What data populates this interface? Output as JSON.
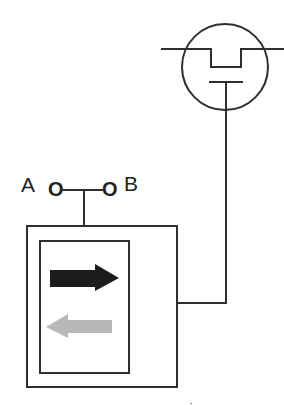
{
  "diagram": {
    "type": "schematic",
    "labels": {
      "terminal_a": "A",
      "terminal_b": "B",
      "node_a_glyph": "O",
      "node_b_glyph": "O"
    },
    "colors": {
      "stroke": "#2f2f2f",
      "forward_arrow": "#1c1c1c",
      "reverse_arrow": "#b8b8b8",
      "background": "#ffffff"
    },
    "components": [
      {
        "id": "transistor",
        "symbol": "circle-with-notched-channel-and-gate",
        "description": "field-effect device symbol"
      },
      {
        "id": "switch",
        "terminals": [
          "A",
          "B"
        ],
        "description": "two-terminal node joined by a horizontal bar with center stem"
      },
      {
        "id": "module",
        "description": "outer box containing inner panel with two direction arrows"
      },
      {
        "id": "forward-arrow",
        "direction": "right",
        "shade": "dark"
      },
      {
        "id": "reverse-arrow",
        "direction": "left",
        "shade": "light"
      }
    ],
    "connections": [
      {
        "from": "switch",
        "to": "module",
        "via": "vertical stem into module top"
      },
      {
        "from": "transistor.gate",
        "to": "module.right",
        "via": "vertical line down then horizontal into module right side"
      }
    ]
  }
}
